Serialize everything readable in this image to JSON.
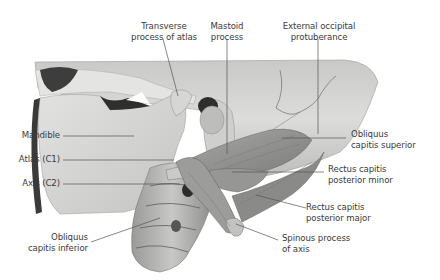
{
  "figure": {
    "colors": {
      "background": "#ffffff",
      "bone_light": "#d9d9d7",
      "bone_mid": "#b9b9b7",
      "bone_dark": "#5a5a5a",
      "muscle": "#8f8f8d",
      "leader_line": "#555555",
      "label_text": "#3a3a3a"
    }
  },
  "labels": {
    "transverse_process_atlas": {
      "line1": "Transverse",
      "line2": "process of atlas"
    },
    "mastoid_process": {
      "line1": "Mastoid",
      "line2": "process"
    },
    "external_occipital_protuberance": {
      "line1": "External occipital",
      "line2": "protuberance"
    },
    "mandible": {
      "text": "Mandible"
    },
    "atlas": {
      "text": "Atlas (C1)"
    },
    "axis": {
      "text": "Axis (C2)"
    },
    "obliquus_capitis_superior": {
      "line1": "Obliquus",
      "line2": "capitis superior"
    },
    "rectus_capitis_posterior_minor": {
      "line1": "Rectus capitis",
      "line2": "posterior minor"
    },
    "rectus_capitis_posterior_major": {
      "line1": "Rectus capitis",
      "line2": "posterior major"
    },
    "obliquus_capitis_inferior": {
      "line1": "Obliquus",
      "line2": "capitis inferior"
    },
    "spinous_process_axis": {
      "line1": "Spinous process",
      "line2": "of axis"
    }
  }
}
